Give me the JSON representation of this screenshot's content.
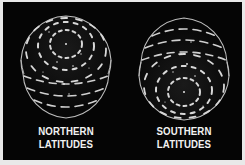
{
  "figure": {
    "background_color": "#050505",
    "page_color": "#e9e9e9",
    "line_color": "#cfcfcf",
    "panels": [
      {
        "id": "northern",
        "label_line1": "NORTHERN",
        "label_line2": "LATITUDES",
        "pole": "top",
        "description": "Globe viewed with concentric circular flow rings near the top pole and dashed latitude arcs below"
      },
      {
        "id": "southern",
        "label_line1": "SOUTHERN",
        "label_line2": "LATITUDES",
        "pole": "bottom",
        "description": "Globe viewed with dashed latitude arcs on top and concentric circular flow rings near the bottom pole"
      }
    ]
  }
}
